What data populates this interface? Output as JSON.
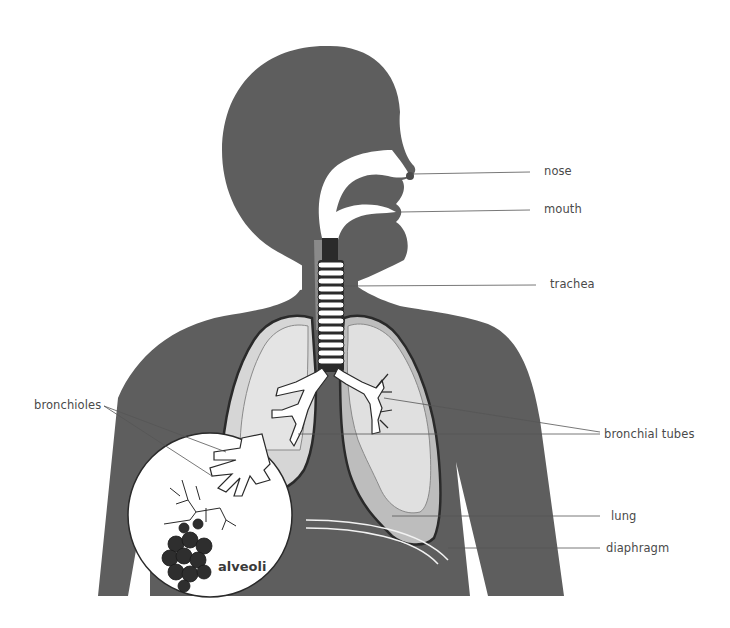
{
  "diagram": {
    "type": "anatomy",
    "colors": {
      "body": "#5e5e5e",
      "lung_fill": "#d6d6d6",
      "lung_inner": "#e4e4e4",
      "lung_lower": "#bdbdbd",
      "airway": "#ffffff",
      "outline": "#2a2a2a",
      "alveoli": "#2e2e2e",
      "leader_line": "#555555",
      "label_text": "#4a4a4a"
    }
  },
  "labels": {
    "nose": "nose",
    "mouth": "mouth",
    "trachea": "trachea",
    "bronchial_tubes": "bronchial tubes",
    "bronchioles": "bronchioles",
    "lung": "lung",
    "diaphragm": "diaphragm",
    "alveoli": "alveoli"
  }
}
